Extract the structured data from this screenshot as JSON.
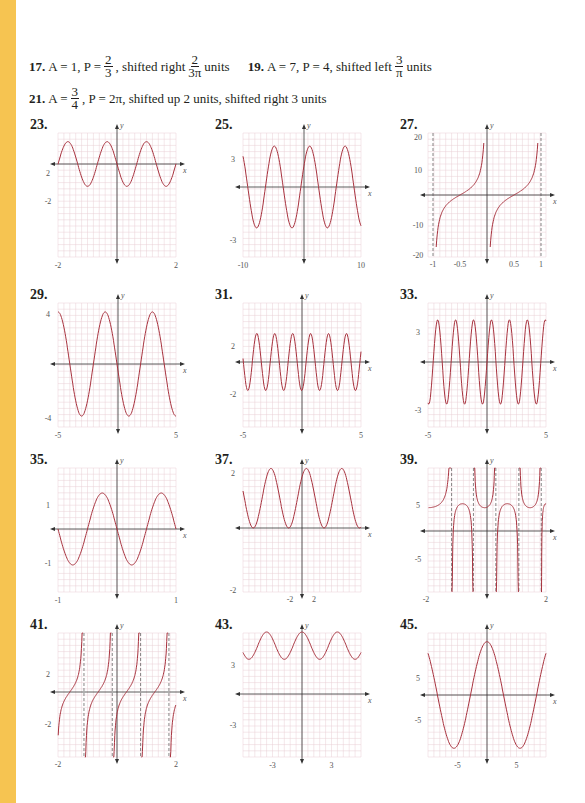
{
  "page": {
    "accent_strip_color": "#f6c451",
    "curve_color": "#a8323e",
    "grid_color": "#e8cfd4",
    "asymptote_color": "#555555"
  },
  "answers_text": {
    "a17": {
      "num": "17.",
      "pre": "A = 1,  P =",
      "p_num": "2",
      "p_den": "3",
      "mid": ", shifted right",
      "s_num": "2",
      "s_den": "3π",
      "post": "units"
    },
    "a19": {
      "num": "19.",
      "pre": "A = 7, P = 4, shifted left",
      "s_num": "3",
      "s_den": "π",
      "post": "units"
    },
    "a21": {
      "num": "21.",
      "pre": "A =",
      "a_num": "3",
      "a_den": "4",
      "post": ", P = 2π, shifted up 2 units, shifted right 3 units"
    }
  },
  "chart_data": [
    {
      "label": "23.",
      "type": "line",
      "func": "2 sin(...) sinusoid",
      "xlim": [
        -2,
        2
      ],
      "ylim": [
        -5,
        5
      ],
      "x_tick_labels": [
        "-2",
        "2"
      ],
      "y_tick_labels": [
        "2",
        "-2"
      ],
      "amplitude": 2,
      "period": 1.333,
      "xlabel": "x",
      "ylabel": "y"
    },
    {
      "label": "25.",
      "type": "line",
      "xlim": [
        -10,
        10
      ],
      "ylim": [
        -5,
        5
      ],
      "x_tick_labels": [
        "-10",
        "10"
      ],
      "y_tick_labels": [
        "3",
        "-3"
      ],
      "amplitude": 3,
      "period": 6,
      "xlabel": "x",
      "ylabel": "y"
    },
    {
      "label": "27.",
      "type": "line",
      "func": "tangent-like",
      "xlim": [
        -1,
        1
      ],
      "ylim": [
        -20,
        20
      ],
      "x_tick_labels": [
        "-1",
        "-0.5",
        "0.5",
        "1"
      ],
      "y_tick_labels": [
        "20",
        "10",
        "-10",
        "-20"
      ],
      "asymptotes": [
        -1,
        0,
        1
      ],
      "zeros": [
        -0.5,
        0.5
      ],
      "xlabel": "x",
      "ylabel": "y"
    },
    {
      "label": "29.",
      "type": "line",
      "xlim": [
        -5,
        5
      ],
      "ylim": [
        -4.5,
        4.5
      ],
      "x_tick_labels": [
        "-5",
        "5"
      ],
      "y_tick_labels": [
        "4",
        "-4"
      ],
      "amplitude": 4,
      "period": 4,
      "xlabel": "x",
      "ylabel": "y"
    },
    {
      "label": "31.",
      "type": "line",
      "xlim": [
        -5,
        5
      ],
      "ylim": [
        -5,
        5
      ],
      "x_tick_labels": [
        "-5",
        "5"
      ],
      "y_tick_labels": [
        "2",
        "-2"
      ],
      "amplitude": 2,
      "period": 1.5,
      "xlabel": "x",
      "ylabel": "y"
    },
    {
      "label": "33.",
      "type": "line",
      "xlim": [
        -5,
        5
      ],
      "ylim": [
        -5,
        5
      ],
      "x_tick_labels": [
        "-5",
        "5"
      ],
      "y_tick_labels": [
        "3",
        "-3"
      ],
      "amplitude": 3,
      "period": 1.5,
      "xlabel": "x",
      "ylabel": "y"
    },
    {
      "label": "35.",
      "type": "line",
      "xlim": [
        -1,
        1
      ],
      "ylim": [
        -2,
        2
      ],
      "x_tick_labels": [
        "-1",
        "1"
      ],
      "y_tick_labels": [
        "1",
        "-1"
      ],
      "amplitude": 1,
      "period": 1,
      "xlabel": "x",
      "ylabel": "y"
    },
    {
      "label": "37.",
      "type": "line",
      "xlim": [
        -2,
        2
      ],
      "ylim": [
        -2,
        2
      ],
      "x_tick_labels": [
        "-2",
        "2"
      ],
      "y_tick_labels": [
        "2",
        "-2"
      ],
      "vertical_shift": 1,
      "amplitude": 1,
      "period": 1.2,
      "xlabel": "x",
      "ylabel": "y"
    },
    {
      "label": "39.",
      "type": "line",
      "func": "secant-like",
      "xlim": [
        -2,
        2
      ],
      "ylim": [
        -10,
        10
      ],
      "x_tick_labels": [
        "-2",
        "2"
      ],
      "y_tick_labels": [
        "5",
        "-5"
      ],
      "xlabel": "x",
      "ylabel": "y"
    },
    {
      "label": "41.",
      "type": "line",
      "func": "tangent-like",
      "xlim": [
        -2,
        2
      ],
      "ylim": [
        -5,
        5
      ],
      "x_tick_labels": [
        "-2",
        "2"
      ],
      "y_tick_labels": [
        "2",
        "-2"
      ],
      "xlabel": "x",
      "ylabel": "y"
    },
    {
      "label": "43.",
      "type": "line",
      "xlim": [
        -5,
        5
      ],
      "ylim": [
        -5,
        5
      ],
      "x_tick_labels": [
        "-3",
        "3"
      ],
      "y_tick_labels": [
        "3",
        "-3"
      ],
      "vertical_shift": 2.2,
      "amplitude": 0.8,
      "period": 3,
      "xlabel": "x",
      "ylabel": "y"
    },
    {
      "label": "45.",
      "type": "line",
      "xlim": [
        -8,
        8
      ],
      "ylim": [
        -10,
        10
      ],
      "x_tick_labels": [
        "-5",
        "5"
      ],
      "y_tick_labels": [
        "5",
        "-5"
      ],
      "amplitude": 5,
      "period": 10,
      "xlabel": "x",
      "ylabel": "y"
    }
  ]
}
